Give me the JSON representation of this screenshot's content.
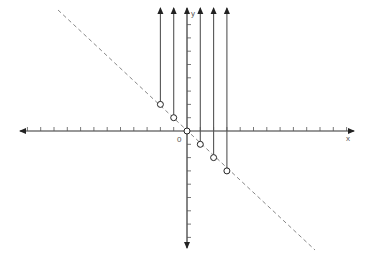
{
  "diagram": {
    "axis_labels": {
      "x": "x",
      "y": "y",
      "origin": "0"
    },
    "origin_px": [
      187,
      131
    ],
    "unit_px": 13.3,
    "x_ticks": 12,
    "y_ticks_up": 8,
    "y_ticks_down": 8,
    "dashed_line": {
      "from": [
        58,
        10
      ],
      "to": [
        315,
        250
      ],
      "equation": "y = -x"
    },
    "points": [
      {
        "x": -2,
        "y": 2
      },
      {
        "x": -1,
        "y": 1
      },
      {
        "x": 0,
        "y": 0
      },
      {
        "x": 1,
        "y": -1
      },
      {
        "x": 2,
        "y": -2
      },
      {
        "x": 3,
        "y": -3
      }
    ],
    "colors": {
      "axis": "#333333",
      "dashed": "#888888",
      "vertical_rays": "#555555"
    }
  }
}
